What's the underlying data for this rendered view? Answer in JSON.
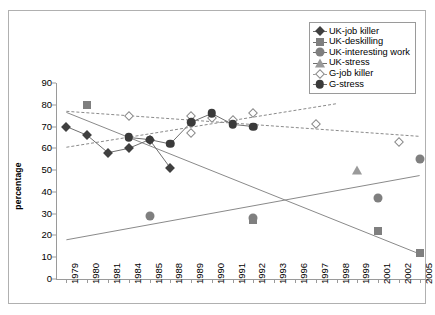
{
  "chart_data": {
    "type": "scatter",
    "title": "",
    "xlabel": "",
    "ylabel": "percentage",
    "ylim": [
      0,
      90
    ],
    "ytick_step": 10,
    "yticks": [
      "90",
      "80",
      "70",
      "60",
      "50",
      "40",
      "30",
      "20",
      "10",
      "0"
    ],
    "grid": false,
    "legend_position": "top-right",
    "categories": [
      "1979",
      "1980",
      "1981",
      "1984",
      "1985",
      "1988",
      "1989",
      "1990",
      "1991",
      "1992",
      "1993",
      "1996",
      "1997",
      "1998",
      "1999",
      "2001",
      "2002",
      "2005"
    ],
    "series": [
      {
        "name": "UK-job killer",
        "marker": "filled-diamond",
        "color": "#404040",
        "connected": true,
        "points": [
          {
            "x": "1979",
            "y": 70
          },
          {
            "x": "1980",
            "y": 66
          },
          {
            "x": "1981",
            "y": 58
          },
          {
            "x": "1984",
            "y": 60
          },
          {
            "x": "1985",
            "y": 64
          },
          {
            "x": "1988",
            "y": 51
          }
        ]
      },
      {
        "name": "UK-deskilling",
        "marker": "filled-square",
        "color": "#7f7f7f",
        "connected": false,
        "points": [
          {
            "x": "1980",
            "y": 80
          },
          {
            "x": "1992",
            "y": 27
          },
          {
            "x": "2001",
            "y": 22
          },
          {
            "x": "2005",
            "y": 12
          }
        ]
      },
      {
        "name": "UK-interesting work",
        "marker": "filled-circle-gray",
        "color": "#7f7f7f",
        "connected": false,
        "points": [
          {
            "x": "1985",
            "y": 29
          },
          {
            "x": "1992",
            "y": 28
          },
          {
            "x": "2001",
            "y": 37
          },
          {
            "x": "2005",
            "y": 55
          }
        ]
      },
      {
        "name": "UK-stress",
        "marker": "filled-triangle",
        "color": "#9a9a9a",
        "connected": false,
        "points": [
          {
            "x": "1999",
            "y": 50
          }
        ]
      },
      {
        "name": "G-job killer",
        "marker": "open-diamond",
        "color": "#8a8a8a",
        "connected": false,
        "points": [
          {
            "x": "1984",
            "y": 75
          },
          {
            "x": "1989",
            "y": 67
          },
          {
            "x": "1989",
            "y": 75
          },
          {
            "x": "1990",
            "y": 74
          },
          {
            "x": "1991",
            "y": 73
          },
          {
            "x": "1992",
            "y": 76
          },
          {
            "x": "1997",
            "y": 71
          },
          {
            "x": "2002",
            "y": 63
          }
        ]
      },
      {
        "name": "G-stress",
        "marker": "filled-circle-dark",
        "color": "#3a3a3a",
        "connected": true,
        "points": [
          {
            "x": "1984",
            "y": 65
          },
          {
            "x": "1985",
            "y": 64
          },
          {
            "x": "1988",
            "y": 62
          },
          {
            "x": "1989",
            "y": 72
          },
          {
            "x": "1990",
            "y": 76
          },
          {
            "x": "1991",
            "y": 71
          },
          {
            "x": "1992",
            "y": 70
          }
        ]
      }
    ],
    "trendlines": [
      {
        "name": "UK-job killer trend",
        "style": "solid",
        "color": "#8a8a8a",
        "from": {
          "x": "1979",
          "y": 76.5
        },
        "to": {
          "x": "2005",
          "y": 11.5
        }
      },
      {
        "name": "UK-interesting work trend",
        "style": "solid",
        "color": "#8a8a8a",
        "from": {
          "x": "1979",
          "y": 18
        },
        "to": {
          "x": "2005",
          "y": 47.5
        }
      },
      {
        "name": "G-job killer trend",
        "style": "dashed",
        "color": "#8a8a8a",
        "from": {
          "x": "1979",
          "y": 77
        },
        "to": {
          "x": "2005",
          "y": 65.5
        }
      },
      {
        "name": "G-stress trend",
        "style": "dashed",
        "color": "#8a8a8a",
        "from": {
          "x": "1979",
          "y": 60.5
        },
        "to": {
          "x": "1998",
          "y": 80.5
        }
      }
    ]
  },
  "legend": {
    "items": [
      {
        "label": "UK-job killer",
        "marker": "filled-diamond"
      },
      {
        "label": "UK-deskilling",
        "marker": "filled-square"
      },
      {
        "label": "UK-interesting work",
        "marker": "filled-circle-gray"
      },
      {
        "label": "UK-stress",
        "marker": "filled-triangle"
      },
      {
        "label": "G-job killer",
        "marker": "open-diamond"
      },
      {
        "label": "G-stress",
        "marker": "filled-circle-dark"
      }
    ]
  },
  "colors": {
    "axis": "#9a9a9a",
    "frame": "#b0b0b0",
    "dark": "#404040",
    "gray": "#7f7f7f",
    "light_gray": "#9a9a9a",
    "background": "#ffffff"
  }
}
